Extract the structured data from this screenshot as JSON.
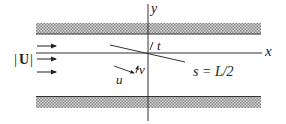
{
  "figure": {
    "labels": {
      "y_axis": "y",
      "x_axis": "x",
      "tangent": "t",
      "velocity_magnitude_bar_left": "|",
      "velocity_magnitude_symbol": "U",
      "velocity_magnitude_bar_right": "|",
      "u_component": "u",
      "v_component": "v",
      "plate_end": "s = L/2"
    },
    "colors": {
      "line": "#222222",
      "hatch_dark": "#8a8a8a",
      "hatch_light": "#d4d4d4",
      "background": "#ffffff"
    },
    "inflow_arrows": 3
  }
}
